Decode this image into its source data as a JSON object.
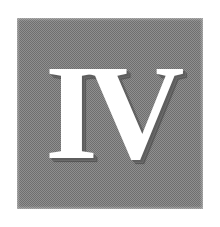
{
  "image": {
    "kind": "scanned-illustration",
    "background_color": "#ffffff",
    "panel": {
      "label": "gray-halftone-panel",
      "fill_color": "#8f8f8f",
      "dither_dark": "#6f6f6f",
      "dither_light": "#b5b5b5",
      "x": 17,
      "y": 18,
      "width": 186,
      "height": 191
    },
    "numeral": {
      "text": "IV",
      "meaning": "roman-numeral-four",
      "color": "#ffffff",
      "shadow_color": "#5e5e5e",
      "style": "bold-serif",
      "x": 60,
      "y": 58,
      "width": 102,
      "height": 100
    }
  }
}
